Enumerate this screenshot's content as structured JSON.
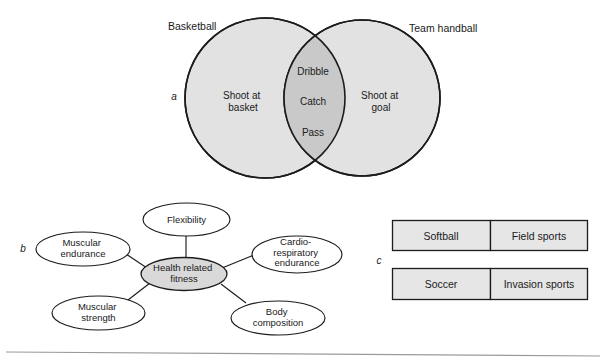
{
  "figure": {
    "parts": [
      {
        "key": "a",
        "letter": "a",
        "type": "venn-diagram"
      },
      {
        "key": "b",
        "letter": "b",
        "type": "spider-diagram"
      },
      {
        "key": "c",
        "letter": "c",
        "type": "label-boxes"
      }
    ]
  },
  "venn": {
    "left_title": "Basketball",
    "right_title": "Team handball",
    "left_only": {
      "line1": "Shoot at",
      "line2": "basket"
    },
    "right_only": {
      "line1": "Shoot at",
      "line2": "goal"
    },
    "overlap": [
      "Dribble",
      "Catch",
      "Pass"
    ],
    "circle_fill": "#e2e2e2",
    "overlap_fill": "#cccccc",
    "outline_color": "#1c1c1c"
  },
  "spider": {
    "center": {
      "line1": "Health related",
      "line2": "fitness",
      "fill": "#d9d9d9"
    },
    "nodes": [
      {
        "id": "flexibility",
        "lines": [
          "Flexibility"
        ]
      },
      {
        "id": "muscular-endurance",
        "lines": [
          "Muscular",
          "endurance"
        ]
      },
      {
        "id": "cardio-respiratory-endurance",
        "lines": [
          "Cardio-",
          "respiratory",
          "endurance"
        ]
      },
      {
        "id": "muscular-strength",
        "lines": [
          "Muscular",
          "strength"
        ]
      },
      {
        "id": "body-composition",
        "lines": [
          "Body",
          "composition"
        ]
      }
    ],
    "node_fill": "#ffffff",
    "outline_color": "#1c1c1c"
  },
  "boxes": {
    "fill": "#e6e6e6",
    "outline_color": "#1c1c1c",
    "rows": [
      {
        "left": "Softball",
        "right": "Field sports"
      },
      {
        "left": "Soccer",
        "right": "Invasion sports"
      }
    ]
  }
}
